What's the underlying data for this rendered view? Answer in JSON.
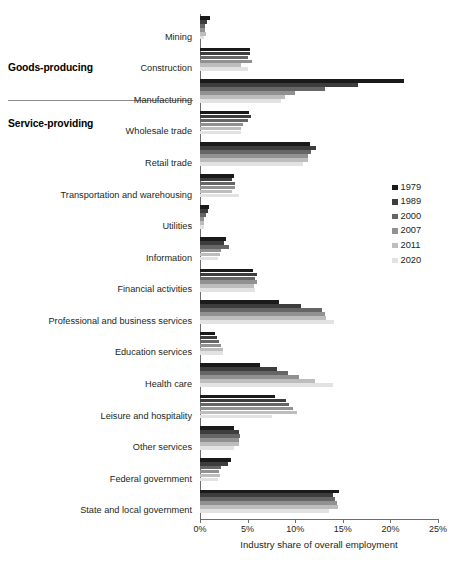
{
  "chart_data": {
    "type": "bar",
    "orientation": "horizontal",
    "title": "",
    "xlabel": "Industry share of overall employment",
    "ylabel": "",
    "xlim": [
      0,
      25
    ],
    "xtick_labels": [
      "0%",
      "5%",
      "10%",
      "15%",
      "20%",
      "25%"
    ],
    "xtick_values": [
      0,
      5,
      10,
      15,
      20,
      25
    ],
    "grid": false,
    "legend_position": "right",
    "categories": [
      "Mining",
      "Construction",
      "Manufacturing",
      "Wholesale trade",
      "Retail trade",
      "Transportation and warehousing",
      "Utilities",
      "Information",
      "Financial activities",
      "Professional and business services",
      "Education services",
      "Health care",
      "Leisure and hospitality",
      "Other services",
      "Federal government",
      "State and local government"
    ],
    "series": [
      {
        "name": "1979",
        "color": "#1a1a1a",
        "values": [
          1.1,
          5.2,
          21.4,
          5.1,
          11.6,
          3.6,
          0.9,
          2.7,
          5.6,
          8.3,
          1.6,
          6.3,
          7.9,
          3.6,
          3.3,
          14.6
        ]
      },
      {
        "name": "1989",
        "color": "#3d3d3d",
        "values": [
          0.7,
          5.2,
          16.6,
          5.4,
          12.2,
          3.4,
          0.8,
          2.5,
          6.0,
          10.6,
          1.8,
          8.1,
          9.0,
          4.1,
          2.9,
          14.0
        ]
      },
      {
        "name": "2000",
        "color": "#666666",
        "values": [
          0.5,
          5.0,
          13.1,
          5.0,
          11.7,
          3.7,
          0.6,
          3.0,
          5.8,
          12.8,
          2.0,
          9.2,
          9.3,
          4.2,
          2.2,
          14.2
        ]
      },
      {
        "name": "2007",
        "color": "#919191",
        "values": [
          0.5,
          5.5,
          10.0,
          4.5,
          11.3,
          3.7,
          0.4,
          2.2,
          6.0,
          13.1,
          2.2,
          10.4,
          9.8,
          4.1,
          2.0,
          14.4
        ]
      },
      {
        "name": "2011",
        "color": "#bdbdbd",
        "values": [
          0.6,
          4.3,
          8.9,
          4.3,
          11.3,
          3.4,
          0.4,
          2.1,
          5.7,
          13.2,
          2.4,
          12.1,
          10.2,
          4.1,
          2.1,
          14.5
        ]
      },
      {
        "name": "2020",
        "color": "#e2e2e2",
        "values": [
          0.4,
          5.0,
          8.5,
          4.3,
          10.8,
          4.1,
          0.4,
          1.9,
          5.8,
          14.1,
          2.4,
          14.0,
          7.6,
          3.6,
          1.9,
          13.6
        ]
      }
    ]
  },
  "group_labels": [
    {
      "text": "Goods-producing"
    },
    {
      "text": "Service-providing"
    }
  ],
  "legend": {
    "entries": [
      "1979",
      "1989",
      "2000",
      "2007",
      "2011",
      "2020"
    ]
  },
  "axis": {
    "xlabel": "Industry share of overall employment"
  }
}
